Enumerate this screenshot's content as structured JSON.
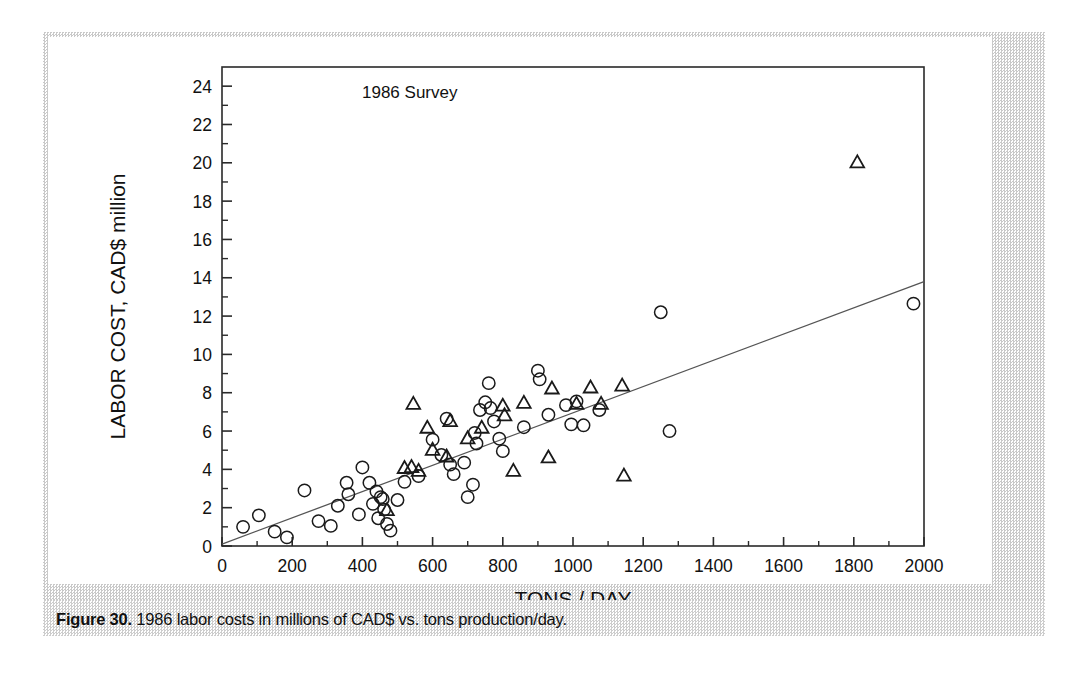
{
  "figure": {
    "caption_label": "Figure 30.",
    "caption_text": " 1986 labor costs in millions of CAD$ vs. tons production/day."
  },
  "chart_data": {
    "type": "scatter",
    "title": "",
    "annotation": "1986 Survey",
    "xlabel": "TONS / DAY",
    "ylabel": "LABOR COST, CAD$ million",
    "xlim": [
      0,
      2000
    ],
    "ylim": [
      0,
      25
    ],
    "xticks": [
      0,
      200,
      400,
      600,
      800,
      1000,
      1200,
      1400,
      1600,
      1800,
      2000
    ],
    "xtick_labels": [
      "0",
      "200",
      "400",
      "600",
      "800",
      "1000",
      "1200",
      "1400",
      "1600",
      "1800",
      "2000"
    ],
    "yticks": [
      0,
      2,
      4,
      6,
      8,
      10,
      12,
      14,
      16,
      18,
      20,
      22,
      24
    ],
    "ytick_labels": [
      "0",
      "2",
      "4",
      "6",
      "8",
      "10",
      "12",
      "14",
      "16",
      "18",
      "20",
      "22",
      "24"
    ],
    "y_minor_ticks": [
      1,
      3,
      5,
      7,
      9,
      11,
      13,
      15,
      17,
      19,
      21,
      23
    ],
    "x_minor_ticks": [
      100,
      300,
      500,
      700,
      900,
      1100,
      1300,
      1500,
      1700,
      1900
    ],
    "grid": false,
    "legend": false,
    "marker_color": "#1a1a1a",
    "line_color": "#555555",
    "axis_color": "#2a2a2a",
    "trendline": {
      "name": "linear fit",
      "x": [
        0,
        2000
      ],
      "y": [
        0.1,
        13.8
      ]
    },
    "series": [
      {
        "name": "circles",
        "marker": "circle",
        "points": [
          [
            60,
            1.0
          ],
          [
            105,
            1.6
          ],
          [
            150,
            0.75
          ],
          [
            185,
            0.45
          ],
          [
            235,
            2.9
          ],
          [
            275,
            1.3
          ],
          [
            310,
            1.05
          ],
          [
            330,
            2.1
          ],
          [
            355,
            3.3
          ],
          [
            360,
            2.7
          ],
          [
            390,
            1.65
          ],
          [
            400,
            4.1
          ],
          [
            420,
            3.3
          ],
          [
            430,
            2.2
          ],
          [
            440,
            2.85
          ],
          [
            445,
            1.45
          ],
          [
            452,
            2.55
          ],
          [
            458,
            2.45
          ],
          [
            462,
            1.9
          ],
          [
            470,
            1.15
          ],
          [
            480,
            0.8
          ],
          [
            500,
            2.4
          ],
          [
            520,
            3.35
          ],
          [
            560,
            3.65
          ],
          [
            600,
            5.55
          ],
          [
            625,
            4.75
          ],
          [
            640,
            6.65
          ],
          [
            650,
            4.25
          ],
          [
            660,
            3.75
          ],
          [
            690,
            4.35
          ],
          [
            700,
            2.55
          ],
          [
            715,
            3.2
          ],
          [
            720,
            5.9
          ],
          [
            725,
            5.35
          ],
          [
            735,
            7.1
          ],
          [
            750,
            7.5
          ],
          [
            760,
            8.5
          ],
          [
            765,
            7.2
          ],
          [
            775,
            6.5
          ],
          [
            790,
            5.6
          ],
          [
            800,
            4.95
          ],
          [
            860,
            6.2
          ],
          [
            900,
            9.15
          ],
          [
            905,
            8.7
          ],
          [
            930,
            6.85
          ],
          [
            980,
            7.35
          ],
          [
            995,
            6.35
          ],
          [
            1010,
            7.55
          ],
          [
            1030,
            6.3
          ],
          [
            1075,
            7.1
          ],
          [
            1250,
            12.2
          ],
          [
            1275,
            6.0
          ],
          [
            1970,
            12.65
          ]
        ]
      },
      {
        "name": "triangles",
        "marker": "triangle",
        "points": [
          [
            470,
            1.85
          ],
          [
            520,
            4.05
          ],
          [
            540,
            4.1
          ],
          [
            545,
            7.4
          ],
          [
            560,
            3.9
          ],
          [
            585,
            6.15
          ],
          [
            600,
            5.0
          ],
          [
            640,
            4.65
          ],
          [
            650,
            6.5
          ],
          [
            700,
            5.6
          ],
          [
            740,
            6.15
          ],
          [
            800,
            7.3
          ],
          [
            805,
            6.8
          ],
          [
            830,
            3.9
          ],
          [
            860,
            7.45
          ],
          [
            930,
            4.6
          ],
          [
            940,
            8.2
          ],
          [
            1010,
            7.4
          ],
          [
            1050,
            8.25
          ],
          [
            1080,
            7.4
          ],
          [
            1140,
            8.35
          ],
          [
            1145,
            3.65
          ],
          [
            1810,
            20.0
          ]
        ]
      }
    ]
  }
}
